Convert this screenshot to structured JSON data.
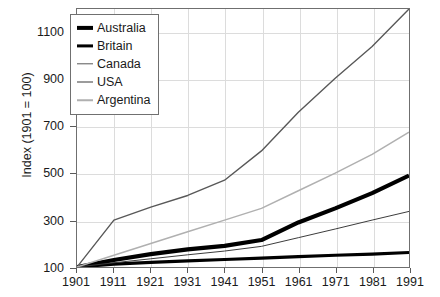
{
  "chart_data": {
    "type": "line",
    "title": "",
    "xlabel": "",
    "ylabel": "Index (1901 = 100)",
    "xlim": [
      1901,
      1991
    ],
    "ylim": [
      100,
      1200
    ],
    "yticks": [
      100,
      300,
      500,
      700,
      900,
      1100
    ],
    "xticks": [
      1901,
      1911,
      1921,
      1931,
      1941,
      1951,
      1961,
      1971,
      1981,
      1991
    ],
    "grid": true,
    "legend_position": "top-left",
    "x": [
      1901,
      1911,
      1921,
      1931,
      1941,
      1951,
      1961,
      1971,
      1981,
      1991
    ],
    "series": [
      {
        "name": "Australia",
        "color": "#000000",
        "width": 4.2,
        "values": [
          100,
          130,
          155,
          175,
          190,
          215,
          290,
          350,
          415,
          490
        ]
      },
      {
        "name": "Britain",
        "color": "#000000",
        "width": 3.2,
        "values": [
          100,
          112,
          120,
          126,
          132,
          138,
          144,
          150,
          155,
          162
        ]
      },
      {
        "name": "Canada",
        "color": "#585858",
        "width": 1.4,
        "values": [
          100,
          300,
          355,
          405,
          470,
          595,
          760,
          905,
          1040,
          1200
        ]
      },
      {
        "name": "USA",
        "color": "#3a3a3a",
        "width": 1.0,
        "values": [
          100,
          118,
          135,
          152,
          168,
          188,
          225,
          262,
          300,
          337
        ]
      },
      {
        "name": "Argentina",
        "color": "#b0b0b0",
        "width": 1.5,
        "values": [
          100,
          150,
          200,
          250,
          300,
          350,
          425,
          500,
          580,
          675
        ]
      }
    ]
  },
  "legend": {
    "entries": [
      {
        "label": "Australia"
      },
      {
        "label": "Britain"
      },
      {
        "label": "Canada"
      },
      {
        "label": "USA"
      },
      {
        "label": "Argentina"
      }
    ]
  }
}
